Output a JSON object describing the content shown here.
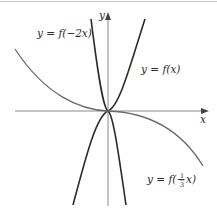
{
  "figure": {
    "axes": {
      "x_label": "x",
      "y_label": "y"
    },
    "curves": [
      {
        "id": "f",
        "label_prefix": "y = f(",
        "label_arg": "x",
        "label_suffix": ")",
        "label": "y = f(x)",
        "description": "cubic-like curve through origin, rising steeply to the right, falling steeply to the left",
        "color": "#2b2b2b"
      },
      {
        "id": "f-neg2x",
        "label_prefix": "y = f(",
        "label_arg": "−2x",
        "label_suffix": ")",
        "label": "y = f(−2x)",
        "description": "horizontal compression by 2 and reflection about y-axis",
        "color": "#2b2b2b"
      },
      {
        "id": "f-neg-third-x",
        "label_prefix": "y = f(−",
        "label_frac_num": "1",
        "label_frac_den": "3",
        "label_arg": "x",
        "label_suffix": ")",
        "label": "y = f(−1/3 x)",
        "description": "horizontal stretch by 3 and reflection about y-axis",
        "color": "#6a6a6a"
      }
    ],
    "colors": {
      "axis": "#7a7a7a",
      "frame_top": "#bdbdbd",
      "background": "#ffffff"
    }
  }
}
